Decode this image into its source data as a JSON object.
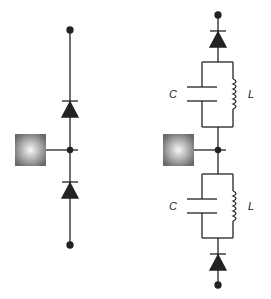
{
  "diagram": {
    "title": "",
    "colors": {
      "wire": "#222222",
      "source_edge": "#6a6a6a",
      "source_center": "#f4f4f4"
    },
    "left_circuit": {
      "description": "Source node between two series diodes",
      "components": [
        "terminal-top",
        "diode-upper",
        "junction",
        "source",
        "diode-lower",
        "terminal-bottom"
      ]
    },
    "right_circuit": {
      "description": "Source node with parallel LC tanks and diodes",
      "upper_tank": {
        "capacitor_label": "C",
        "inductor_label": "L"
      },
      "lower_tank": {
        "capacitor_label": "C",
        "inductor_label": "L"
      }
    }
  }
}
